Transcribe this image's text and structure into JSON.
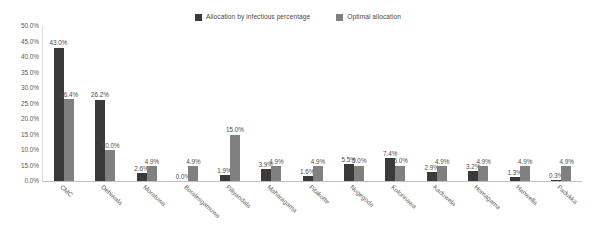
{
  "chart_data": {
    "type": "bar",
    "title": "",
    "xlabel": "",
    "ylabel": "",
    "ylim": [
      0,
      50
    ],
    "grid": false,
    "legend_position": "top-center",
    "categories": [
      "CMC",
      "Dehiwala",
      "Moratuwa",
      "Boralesgamuwa",
      "Piliyandala",
      "Maharagama",
      "Pitakotte",
      "Nugegoda",
      "Kolonnawa",
      "Kaduwela",
      "Homagama",
      "Hanwella",
      "Padukka"
    ],
    "series": [
      {
        "name": "Allocation by infectious percentage",
        "color": "#3a3a3a",
        "values": [
          43.0,
          26.2,
          2.6,
          0.0,
          1.9,
          3.9,
          1.6,
          5.5,
          7.4,
          2.9,
          3.2,
          1.3,
          0.3
        ],
        "labels": [
          "43.0%",
          "26.2%",
          "2.6%",
          "0.0%",
          "1.9%",
          "3.9%",
          "1.6%",
          "5.5%",
          "7.4%",
          "2.9%",
          "3.2%",
          "1.3%",
          "0.3%"
        ]
      },
      {
        "name": "Optimal allocation",
        "color": "#808080",
        "values": [
          26.4,
          10.0,
          4.9,
          4.9,
          15.0,
          4.9,
          4.9,
          5.0,
          5.0,
          4.9,
          4.9,
          4.9,
          4.9
        ],
        "labels": [
          "26.4%",
          "10.0%",
          "4.9%",
          "4.9%",
          "15.0%",
          "4.9%",
          "4.9%",
          "5.0%",
          "5.0%",
          "4.9%",
          "4.9%",
          "4.9%",
          "4.9%"
        ]
      }
    ],
    "y_ticks": [
      {
        "value": 50,
        "label": "50.0%"
      },
      {
        "value": 45,
        "label": "45.0%"
      },
      {
        "value": 40,
        "label": "40.0%"
      },
      {
        "value": 35,
        "label": "35.0%"
      },
      {
        "value": 30,
        "label": "30.0%"
      },
      {
        "value": 25,
        "label": "25.0%"
      },
      {
        "value": 20,
        "label": "20.0%"
      },
      {
        "value": 15,
        "label": "15.0%"
      },
      {
        "value": 10,
        "label": "10.0%"
      },
      {
        "value": 5,
        "label": "15.0%"
      },
      {
        "value": 0,
        "label": "0.0%"
      }
    ]
  }
}
